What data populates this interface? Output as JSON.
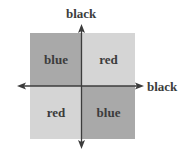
{
  "diagram": {
    "type": "quadrant-grid",
    "axes": {
      "vertical": {
        "label": "black",
        "arrows": [
          "up",
          "down"
        ]
      },
      "horizontal": {
        "label": "black",
        "arrows": [
          "left",
          "right"
        ]
      }
    },
    "quadrants": [
      {
        "position": "top-left",
        "label": "blue",
        "fill": "#a9a9a9"
      },
      {
        "position": "top-right",
        "label": "red",
        "fill": "#d5d5d5"
      },
      {
        "position": "bottom-left",
        "label": "red",
        "fill": "#d5d5d5"
      },
      {
        "position": "bottom-right",
        "label": "blue",
        "fill": "#a9a9a9"
      }
    ],
    "colors": {
      "axis": "#3c3c3c",
      "text": "#3c3c3c",
      "dark_quadrant": "#a9a9a9",
      "light_quadrant": "#d5d5d5"
    }
  }
}
